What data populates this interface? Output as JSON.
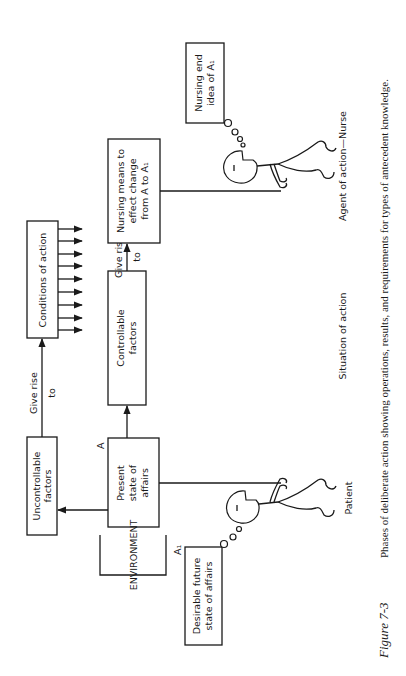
{
  "figure": {
    "number": "Figure 7-3",
    "caption": "Phases of deliberate action showing operations, results, and requirements for types of antecedent knowledge.",
    "orientation": "rotated 90 degrees counter-clockwise"
  },
  "boxes": {
    "uncontrollable": [
      "Uncontrollable",
      "factors"
    ],
    "conditions": [
      "Conditions of action"
    ],
    "present": [
      "Present",
      "state of",
      "affairs"
    ],
    "controllable": [
      "Controllable",
      "factors"
    ],
    "nursing_means": [
      "Nursing means to",
      "effect change",
      "from A to A₁"
    ],
    "nursing_end": [
      "Nursing end",
      "idea of A₁"
    ],
    "desirable": [
      "Desirable future",
      "state of affairs"
    ]
  },
  "arrow_labels": {
    "give_rise_1": [
      "Give rise",
      "to"
    ],
    "give_rise_2": [
      "Give rise",
      "to"
    ]
  },
  "markers": {
    "a": "A",
    "a1": "A₁"
  },
  "labels": {
    "environment": "ENVIRONMENT",
    "patient": "Patient",
    "situation": "Situation of action",
    "agent": "Agent of action—Nurse"
  },
  "conditions_arrow_count": 9
}
